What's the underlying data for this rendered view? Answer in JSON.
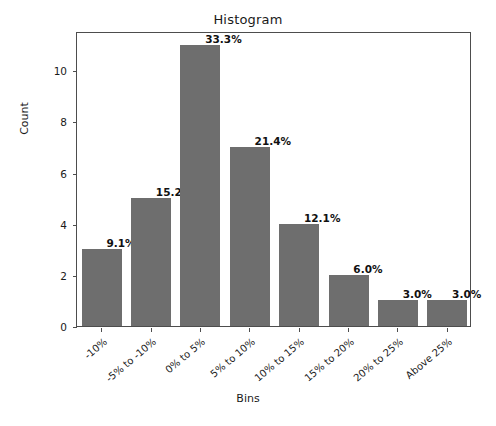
{
  "chart_data": {
    "type": "bar",
    "title": "Histogram",
    "xlabel": "Bins",
    "ylabel": "Count",
    "categories": [
      "-10%",
      "-5% to -10%",
      "0% to 5%",
      "5% to 10%",
      "10% to 15%",
      "15% to 20%",
      "20% to 25%",
      "Above 25%"
    ],
    "values": [
      3,
      5,
      11,
      7,
      4,
      2,
      1,
      1
    ],
    "bar_labels": [
      "9.1%",
      "15.2%",
      "33.3%",
      "21.4%",
      "12.1%",
      "6.0%",
      "3.0%",
      "3.0%"
    ],
    "ylim": [
      0,
      11.54
    ],
    "yticks": [
      0,
      2,
      4,
      6,
      8,
      10
    ],
    "ytick_labels": [
      "0",
      "2",
      "4",
      "6",
      "8",
      "10"
    ],
    "grid": false,
    "legend": false,
    "bar_color": "#6e6e6e",
    "axis_color": "#4d4d4d",
    "text_color": "#1a1a1a",
    "background": "#ffffff"
  }
}
